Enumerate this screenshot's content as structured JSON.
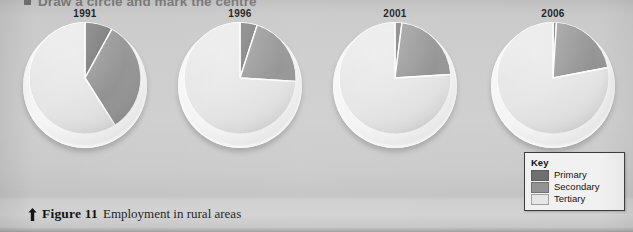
{
  "instruction": {
    "bullet_icon": "square-bullet-icon",
    "text": "Draw a circle and mark the centre"
  },
  "caption": {
    "arrow_icon": "up-arrow-icon",
    "figure_number": "Figure 11",
    "text": "Employment in rural areas"
  },
  "key": {
    "title": "Key",
    "entries": [
      {
        "label": "Primary",
        "color": "#6e6e6e"
      },
      {
        "label": "Secondary",
        "color": "#929292"
      },
      {
        "label": "Tertiary",
        "color": "#e6e6e6"
      }
    ]
  },
  "colors": {
    "primary": "#6e6e6e",
    "secondary": "#929292",
    "tertiary": "#e6e6e6",
    "slice_divider": "#ffffff",
    "disc_rim": "#f6f6f6",
    "background": "#cdcdcd",
    "text": "#1a1a1a"
  },
  "chart_data": [
    {
      "type": "pie",
      "title": "1991",
      "categories": [
        "Primary",
        "Secondary",
        "Tertiary"
      ],
      "values": [
        8,
        33,
        59
      ],
      "unit": "%",
      "start_angle_deg": 0,
      "direction": "clockwise",
      "legend_position": "bottom-right"
    },
    {
      "type": "pie",
      "title": "1996",
      "categories": [
        "Primary",
        "Secondary",
        "Tertiary"
      ],
      "values": [
        5,
        21,
        74
      ],
      "unit": "%",
      "start_angle_deg": 0,
      "direction": "clockwise",
      "legend_position": "bottom-right"
    },
    {
      "type": "pie",
      "title": "2001",
      "categories": [
        "Primary",
        "Secondary",
        "Tertiary"
      ],
      "values": [
        2,
        22,
        76
      ],
      "unit": "%",
      "start_angle_deg": 0,
      "direction": "clockwise",
      "legend_position": "bottom-right"
    },
    {
      "type": "pie",
      "title": "2006",
      "categories": [
        "Primary",
        "Secondary",
        "Tertiary"
      ],
      "values": [
        1,
        21,
        78
      ],
      "unit": "%",
      "start_angle_deg": 0,
      "direction": "clockwise",
      "legend_position": "bottom-right"
    }
  ],
  "charts_layout": {
    "left_offsets": [
      10,
      165,
      320,
      478
    ]
  }
}
